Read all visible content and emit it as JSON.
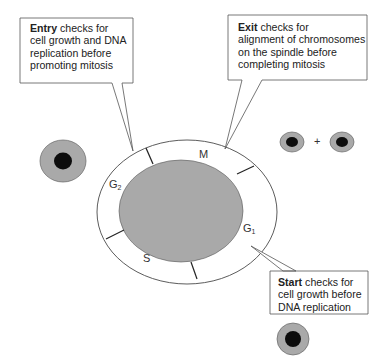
{
  "callouts": {
    "entry": {
      "title": "Entry",
      "body": " checks for",
      "lines": [
        "cell growth and DNA",
        "replication before",
        "promoting mitosis"
      ]
    },
    "exit": {
      "title": "Exit",
      "body": " checks for",
      "lines": [
        "alignment of chromosomes",
        "on the spindle before",
        "completing mitosis"
      ]
    },
    "start": {
      "title": "Start",
      "body": " checks for",
      "lines": [
        "cell growth before",
        "DNA replication"
      ]
    }
  },
  "phases": {
    "m": {
      "label": "M",
      "sub": ""
    },
    "g1": {
      "label": "G",
      "sub": "1"
    },
    "s": {
      "label": "S",
      "sub": ""
    },
    "g2": {
      "label": "G",
      "sub": "2"
    }
  },
  "symbols": {
    "plus": "+"
  },
  "colors": {
    "cytoplasm": "#a9a9a9",
    "nucleus": "#0c0c0c",
    "ring_fill": "#ffffff",
    "stroke": "#3a3a3a"
  }
}
